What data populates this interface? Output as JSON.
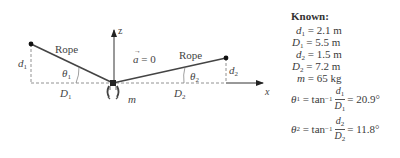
{
  "diagram": {
    "left_rope_label": "Rope",
    "right_rope_label": "Rope",
    "acceleration_label": "a = 0",
    "acceleration_symbol": "a",
    "acceleration_value": "= 0",
    "z_axis_label": "z",
    "x_axis_label": "x",
    "mass_label": "m",
    "d1_label": "d",
    "d1_sub": "1",
    "d2_label": "d",
    "d2_sub": "2",
    "D1_label": "D",
    "D1_sub": "1",
    "D2_label": "D",
    "D2_sub": "2",
    "theta1_label": "θ",
    "theta1_sub": "1",
    "theta2_label": "θ",
    "theta2_sub": "2",
    "colors": {
      "rope": "#444444",
      "dashed": "#777777",
      "axis": "#333333"
    }
  },
  "known": {
    "title": "Known:",
    "rows": [
      {
        "var": "d",
        "sub": "1",
        "eq": "= 2.1 m"
      },
      {
        "var": "D",
        "sub": "1",
        "eq": "= 5.5 m"
      },
      {
        "var": "d",
        "sub": "2",
        "eq": "= 1.5 m"
      },
      {
        "var": "D",
        "sub": "2",
        "eq": "= 7.2 m"
      },
      {
        "var": "m",
        "sub": "",
        "eq": "= 65 kg"
      }
    ],
    "theta1": {
      "lhs": "θ",
      "sub": "1",
      "func": "= tan",
      "exp": "−1",
      "num_var": "d",
      "num_sub": "1",
      "den_var": "D",
      "den_sub": "1",
      "result": "= 20.9°"
    },
    "theta2": {
      "lhs": "θ",
      "sub": "2",
      "func": "= tan",
      "exp": "−1",
      "num_var": "d",
      "num_sub": "2",
      "den_var": "D",
      "den_sub": "2",
      "result": "= 11.8°"
    }
  }
}
